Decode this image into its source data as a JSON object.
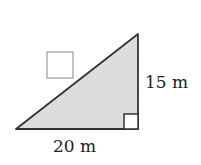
{
  "diagram": {
    "shape": "right-triangle",
    "fill": "#d9d9d9",
    "stroke": "#333333",
    "height_label": "15 m",
    "base_label": "20 m",
    "answer_box": "",
    "right_angle_marker": true
  }
}
